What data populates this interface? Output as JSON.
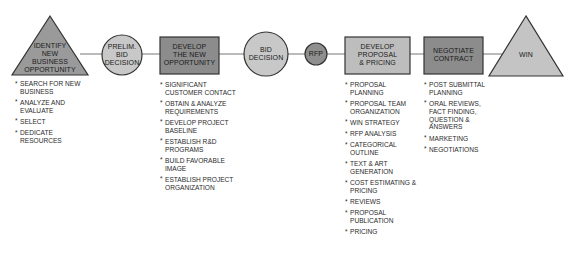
{
  "colors": {
    "triangle_identify": "#9a9a9a",
    "circle_fill": "#c8c8c8",
    "rect_dark": "#8c8c8c",
    "rect_light": "#bdbdbd",
    "rfp_fill": "#8f8f8f",
    "win_fill": "#c4c4c4",
    "outline": "#333333",
    "connector": "#777777"
  },
  "nodes": [
    {
      "id": "identify",
      "shape": "triangle",
      "label_lines": [
        "IDENTIFY",
        "NEW",
        "BUSINESS",
        "OPPORTUNITY"
      ]
    },
    {
      "id": "prelim",
      "shape": "circle",
      "label_lines": [
        "PRELIM.",
        "BID",
        "DECISION"
      ]
    },
    {
      "id": "develop-opportunity",
      "shape": "rectangle",
      "label_lines": [
        "DEVELOP",
        "THE NEW",
        "OPPORTUNITY"
      ]
    },
    {
      "id": "bid",
      "shape": "circle",
      "label_lines": [
        "BID",
        "DECISION"
      ]
    },
    {
      "id": "rfp",
      "shape": "circle",
      "label_lines": [
        "RFP"
      ]
    },
    {
      "id": "develop-proposal",
      "shape": "rectangle",
      "label_lines": [
        "DEVELOP",
        "PROPOSAL",
        "& PRICING"
      ]
    },
    {
      "id": "negotiate",
      "shape": "rectangle",
      "label_lines": [
        "NEGOTIATE",
        "CONTRACT"
      ]
    },
    {
      "id": "win",
      "shape": "triangle",
      "label_lines": [
        "WIN"
      ]
    }
  ],
  "labels": {
    "identify": "IDENTIFY\nNEW\nBUSINESS\nOPPORTUNITY",
    "prelim": "PRELIM.\nBID\nDECISION",
    "develop_opportunity": "DEVELOP\nTHE NEW\nOPPORTUNITY",
    "bid": "BID\nDECISION",
    "rfp": "RFP",
    "develop_proposal": "DEVELOP\nPROPOSAL\n& PRICING",
    "negotiate": "NEGOTIATE\nCONTRACT",
    "win": "WIN"
  },
  "lists": {
    "identify": [
      "SEARCH FOR NEW BUSINESS",
      "ANALYZE AND EVALUATE",
      "SELECT",
      "DEDICATE RESOURCES"
    ],
    "develop_opportunity": [
      "SIGNIFICANT CUSTOMER CONTACT",
      "OBTAIN & ANALYZE REQUIREMENTS",
      "DEVELOP PROJECT BASELINE",
      "ESTABLISH R&D PROGRAMS",
      "BUILD FAVORABLE IMAGE",
      "ESTABLISH PROJECT ORGANIZATION"
    ],
    "develop_proposal": [
      "PROPOSAL PLANNING",
      "PROPOSAL TEAM ORGANIZATION",
      "WIN STRATEGY",
      "RFP ANALYSIS",
      "CATEGORICAL OUTLINE",
      "TEXT & ART GENERATION",
      "COST ESTIMATING & PRICING",
      "REVIEWS",
      "PROPOSAL PUBLICATION",
      "PRICING"
    ],
    "negotiate": [
      "POST SUBMITTAL PLANNING",
      "ORAL REVIEWS, FACT FINDING, QUESTION & ANSWERS",
      "MARKETING",
      "NEGOTIATIONS"
    ]
  }
}
